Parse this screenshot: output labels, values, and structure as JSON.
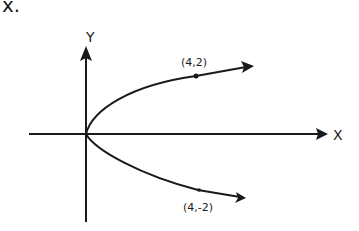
{
  "header_fragment": "x.",
  "axes": {
    "x_label": "X",
    "y_label": "Y"
  },
  "points": [
    {
      "label": "(4,2)"
    },
    {
      "label": "(4,-2)"
    }
  ],
  "colors": {
    "ink": "#1a1a1a",
    "background": "#ffffff"
  }
}
